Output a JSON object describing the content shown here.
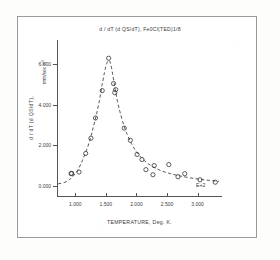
{
  "chart_data": {
    "type": "scatter",
    "title": "d / dT (d QS/dT),  Fe0Cl(TED)1/8",
    "xlabel": "TEMPERATURE, Deg. K.",
    "ylabel": "d / dT (d QS/dT),",
    "ylabel_units": "mm/sec  K",
    "ylabel_units_exp": "2",
    "x_exponent_label": "E+2",
    "xlim": [
      0.7,
      3.4
    ],
    "ylim": [
      -0.55,
      7.2
    ],
    "grid": false,
    "legend": null,
    "xticks": [
      1.0,
      1.5,
      2.0,
      2.5,
      3.0
    ],
    "xticklabels": [
      "1.000",
      "1.500",
      "2.000",
      "2.500",
      "3.000"
    ],
    "yticks": [
      0,
      2,
      4,
      6
    ],
    "yticklabels": [
      "0.000",
      "2.000",
      "4.000",
      "6.000"
    ],
    "marker_style": "open-circle",
    "series": [
      {
        "name": "data points",
        "x": [
          0.93,
          0.94,
          1.06,
          1.17,
          1.255,
          1.33,
          1.44,
          1.545,
          1.625,
          1.645,
          1.66,
          1.8,
          1.9,
          2.01,
          2.09,
          2.155,
          2.27,
          2.29,
          2.53,
          2.68,
          2.79,
          3.04,
          3.29
        ],
        "y": [
          0.6,
          0.62,
          0.68,
          1.6,
          2.35,
          3.35,
          4.7,
          6.3,
          5.05,
          4.6,
          4.75,
          2.85,
          2.25,
          1.55,
          1.3,
          0.8,
          0.55,
          1.0,
          1.05,
          0.45,
          0.6,
          0.3,
          0.18
        ]
      }
    ],
    "fit_curve": {
      "name": "fitted dashed curve",
      "style": "dashed",
      "x": [
        0.72,
        0.85,
        0.95,
        1.05,
        1.13,
        1.22,
        1.3,
        1.38,
        1.45,
        1.5,
        1.545,
        1.58,
        1.62,
        1.66,
        1.72,
        1.8,
        1.88,
        1.96,
        2.05,
        2.15,
        2.28,
        2.42,
        2.58,
        2.75,
        2.95,
        3.15,
        3.35
      ],
      "y": [
        0.1,
        0.18,
        0.42,
        0.8,
        1.35,
        2.05,
        2.95,
        3.95,
        5.2,
        5.95,
        6.25,
        6.05,
        5.35,
        4.6,
        3.75,
        2.9,
        2.3,
        1.85,
        1.48,
        1.18,
        0.92,
        0.72,
        0.58,
        0.46,
        0.36,
        0.28,
        0.22
      ]
    }
  },
  "page": {
    "document_kind": "scanned-plot"
  }
}
